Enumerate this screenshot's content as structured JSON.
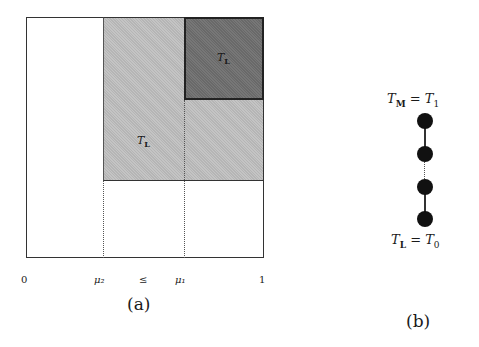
{
  "panel_a": {
    "region_light_label": {
      "main": "T",
      "sub": "L"
    },
    "region_dark_label": {
      "main": "T",
      "sub": "L"
    },
    "axis_ticks": [
      "0",
      "μ₂",
      "≤",
      "μ₁",
      "1"
    ],
    "caption": "(a)"
  },
  "panel_b": {
    "top_label": {
      "main": "T",
      "sub": "M",
      "eq": " = ",
      "rhs": "T",
      "rhs_sub": "1"
    },
    "bottom_label": {
      "main": "T",
      "sub": "L",
      "eq": " = ",
      "rhs": "T",
      "rhs_sub": "0"
    },
    "node_count": "4",
    "caption": "(b)"
  }
}
